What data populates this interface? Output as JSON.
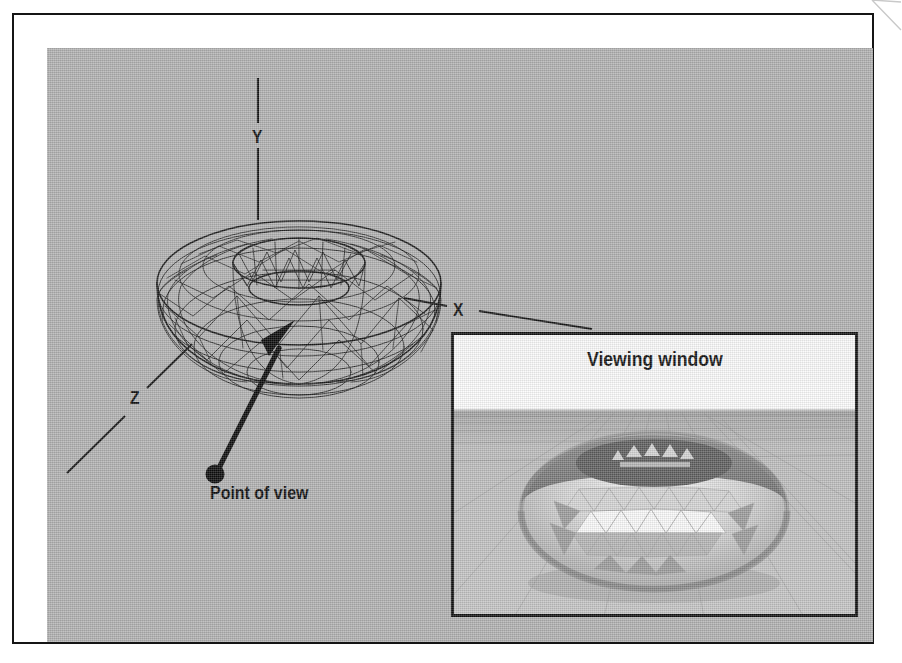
{
  "figure": {
    "kind": "3d-rendering-diagram",
    "background_color": "#b2b2b2",
    "frame_color": "#151515",
    "ink_color": "#101010"
  },
  "axes": {
    "y_label": "Y",
    "x_label": "X",
    "z_label": "Z"
  },
  "annotations": {
    "point_of_view": "Point of view"
  },
  "viewing_window": {
    "title": "Viewing window",
    "border_color": "#121212",
    "title_band_color": "#fbfbfb",
    "sky_color": "#fdfdfd",
    "ground_color": "#bdbdbd"
  },
  "objects": {
    "wireframe_torus": "torus-wireframe",
    "shaded_torus": "torus-shaded"
  },
  "icons": {
    "view-direction-arrow": "arrow-pointing-to-torus",
    "point-of-view-marker": "filled-dot",
    "corner-fold": "page-corner-fold"
  }
}
